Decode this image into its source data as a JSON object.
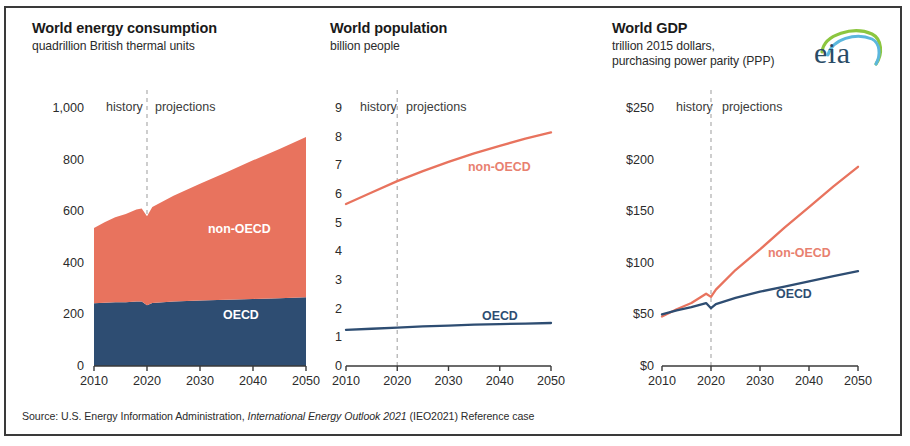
{
  "figure": {
    "source_prefix": "Source:  U.S. Energy Information Administration, ",
    "source_italic": "International Energy Outlook 2021",
    "source_suffix": " (IEO2021) Reference case",
    "logo_text": "eia",
    "logo_name": "eia-logo",
    "colors": {
      "non_oecd": "#e8735e",
      "oecd": "#2e4d72",
      "divider": "#b9b9b9",
      "axis": "#3a3a3a",
      "text": "#231f20",
      "logo_navy": "#2a4b66",
      "logo_green": "#8cc63f",
      "logo_blue": "#5bb7dd"
    },
    "history_label": "history",
    "projections_label": "projections",
    "divider_year": 2020
  },
  "chart_data": [
    {
      "type": "area",
      "title": "World energy consumption",
      "subtitle": "quadrillion British thermal units",
      "xlabel": "",
      "ylabel": "",
      "ylim": [
        0,
        1000
      ],
      "yticks": [
        0,
        200,
        400,
        600,
        800,
        1000
      ],
      "ytick_labels": [
        "0",
        "200",
        "400",
        "600",
        "800",
        "1,000"
      ],
      "xlim": [
        2010,
        2050
      ],
      "xticks": [
        2010,
        2020,
        2030,
        2040,
        2050
      ],
      "xtick_labels": [
        "2010",
        "2020",
        "2030",
        "2040",
        "2050"
      ],
      "grid": false,
      "stacked": true,
      "legend_position": "inside",
      "x": [
        2010,
        2012,
        2014,
        2016,
        2018,
        2019,
        2020,
        2021,
        2025,
        2030,
        2035,
        2040,
        2045,
        2050
      ],
      "series": [
        {
          "name": "OECD",
          "color": "#2e4d72",
          "values": [
            243,
            245,
            247,
            247,
            250,
            250,
            235,
            244,
            250,
            254,
            257,
            260,
            263,
            266
          ]
        },
        {
          "name": "non-OECD",
          "color": "#e8735e",
          "values": [
            292,
            312,
            330,
            342,
            357,
            360,
            345,
            372,
            410,
            452,
            494,
            537,
            578,
            622
          ]
        }
      ],
      "totals": [
        535,
        557,
        577,
        589,
        607,
        610,
        580,
        616,
        660,
        706,
        751,
        797,
        841,
        888
      ]
    },
    {
      "type": "line",
      "title": "World population",
      "subtitle": "billion people",
      "xlabel": "",
      "ylabel": "",
      "ylim": [
        0,
        9
      ],
      "yticks": [
        0,
        1,
        2,
        3,
        4,
        5,
        6,
        7,
        8,
        9
      ],
      "ytick_labels": [
        "0",
        "1",
        "2",
        "3",
        "4",
        "5",
        "6",
        "7",
        "8",
        "9"
      ],
      "xlim": [
        2010,
        2050
      ],
      "xticks": [
        2010,
        2020,
        2030,
        2040,
        2050
      ],
      "xtick_labels": [
        "2010",
        "2020",
        "2030",
        "2040",
        "2050"
      ],
      "grid": false,
      "legend_position": "inside",
      "x": [
        2010,
        2015,
        2020,
        2025,
        2030,
        2035,
        2040,
        2045,
        2050
      ],
      "series": [
        {
          "name": "non-OECD",
          "color": "#e8735e",
          "values": [
            5.65,
            6.05,
            6.45,
            6.8,
            7.12,
            7.42,
            7.68,
            7.93,
            8.15
          ]
        },
        {
          "name": "OECD",
          "color": "#2e4d72",
          "values": [
            1.26,
            1.3,
            1.34,
            1.38,
            1.41,
            1.44,
            1.46,
            1.48,
            1.5
          ]
        }
      ]
    },
    {
      "type": "line",
      "title": "World GDP",
      "subtitle": "trillion 2015 dollars,",
      "subtitle2": "purchasing power parity (PPP)",
      "xlabel": "",
      "ylabel": "",
      "ylim": [
        0,
        250
      ],
      "yticks": [
        0,
        50,
        100,
        150,
        200,
        250
      ],
      "ytick_labels": [
        "$0",
        "$50",
        "$100",
        "$150",
        "$200",
        "$250"
      ],
      "xlim": [
        2010,
        2050
      ],
      "xticks": [
        2010,
        2020,
        2030,
        2040,
        2050
      ],
      "xtick_labels": [
        "2010",
        "2020",
        "2030",
        "2040",
        "2050"
      ],
      "grid": false,
      "legend_position": "inside",
      "x": [
        2010,
        2013,
        2016,
        2019,
        2020,
        2021,
        2025,
        2030,
        2035,
        2040,
        2045,
        2050
      ],
      "series": [
        {
          "name": "non-OECD",
          "color": "#e8735e",
          "values": [
            48,
            55,
            61,
            70,
            67,
            74,
            93,
            113,
            134,
            154,
            174,
            193
          ]
        },
        {
          "name": "OECD",
          "color": "#2e4d72",
          "values": [
            50,
            54,
            57,
            61,
            56,
            60,
            66,
            72,
            77,
            82,
            87,
            92
          ]
        }
      ]
    }
  ]
}
